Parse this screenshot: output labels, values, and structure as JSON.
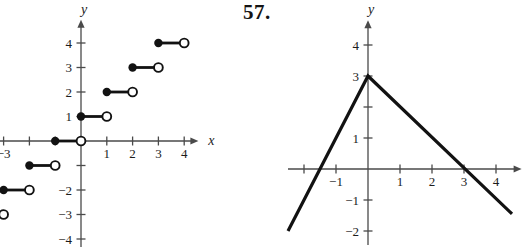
{
  "page": {
    "background": "#ffffff"
  },
  "header": {
    "problem_number": "57."
  },
  "colors": {
    "axis": "#4a4a4a",
    "ink": "#121212",
    "open_point_fill": "#ffffff"
  },
  "chart_data": [
    {
      "id": "step-function-graph",
      "type": "step",
      "title": "",
      "xlabel": "x",
      "ylabel": "y",
      "xlim": [
        -3.2,
        4.55
      ],
      "ylim": [
        -4.35,
        4.95
      ],
      "grid": false,
      "x_ticks": [
        -3,
        -2,
        -1,
        1,
        2,
        3,
        4
      ],
      "x_tick_labels": [
        "−3",
        "",
        "",
        "1",
        "2",
        "3",
        "4"
      ],
      "y_ticks": [
        4,
        3,
        2,
        1,
        -1,
        -2,
        -3,
        -4
      ],
      "y_tick_labels": [
        "4",
        "3",
        "2",
        "1",
        "",
        "−2",
        "−3",
        "−4"
      ],
      "segments": [
        {
          "y": 4,
          "x_closed": 3,
          "x_open": 4
        },
        {
          "y": 3,
          "x_closed": 2,
          "x_open": 3
        },
        {
          "y": 2,
          "x_closed": 1,
          "x_open": 2
        },
        {
          "y": 1,
          "x_closed": 0,
          "x_open": 1
        },
        {
          "y": 0,
          "x_closed": -1,
          "x_open": 0
        },
        {
          "y": -1,
          "x_closed": -2,
          "x_open": -1
        },
        {
          "y": -2,
          "x_closed": -3,
          "x_open": -2
        },
        {
          "y": -3,
          "x_closed": -4,
          "x_open": -3
        }
      ],
      "origin_px": [
        81,
        141
      ],
      "unit_px": [
        25.8,
        24.5
      ]
    },
    {
      "id": "absolute-value-graph",
      "type": "line",
      "title": "",
      "xlabel": "",
      "ylabel": "y",
      "xlim": [
        -2.5,
        4.8
      ],
      "ylim": [
        -2.45,
        4.8
      ],
      "grid": false,
      "x_ticks": [
        -2,
        -1,
        1,
        2,
        3,
        4
      ],
      "x_tick_labels": [
        "",
        "−1",
        "1",
        "2",
        "3",
        "4"
      ],
      "y_ticks": [
        4,
        3,
        2,
        1,
        -1,
        -2
      ],
      "y_tick_labels": [
        "4",
        "3",
        "",
        "1",
        "−1",
        "−2"
      ],
      "points": [
        [
          -2.5,
          -2
        ],
        [
          0,
          3
        ],
        [
          4.5,
          -1.45
        ]
      ],
      "vertex": [
        0,
        3
      ],
      "x_intercepts": [
        -1.5,
        3
      ],
      "origin_px": [
        105,
        169
      ],
      "unit_px": [
        32,
        31
      ]
    }
  ]
}
